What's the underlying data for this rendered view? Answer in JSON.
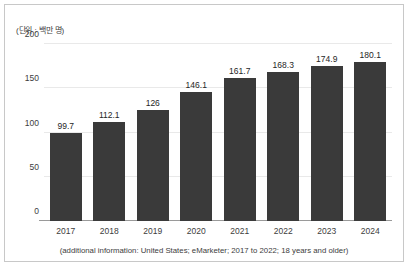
{
  "chart_data": {
    "type": "bar",
    "title": "",
    "subtitle": "",
    "unit_label": "(단위 : 백만 명)",
    "categories": [
      "2017",
      "2018",
      "2019",
      "2020",
      "2021",
      "2022",
      "2023",
      "2024"
    ],
    "values": [
      99.7,
      112.1,
      126,
      146.1,
      161.7,
      168.3,
      174.9,
      180.1
    ],
    "value_labels": [
      "99.7",
      "112.1",
      "126",
      "146.1",
      "161.7",
      "168.3",
      "174.9",
      "180.1"
    ],
    "xlabel": "",
    "ylabel": "",
    "ylim": [
      0,
      200
    ],
    "yticks": [
      0,
      50,
      100,
      150,
      200
    ],
    "ytick_labels": [
      "0",
      "50",
      "100",
      "150",
      "200"
    ],
    "grid": true,
    "legend": false,
    "legend_position": "none",
    "bar_color": "#3a3a3a",
    "background_color": "#ffffff",
    "gridline_color": "#e9e9e9",
    "footnote": "(additional information: United States; eMarketer; 2017 to 2022; 18 years and older)"
  }
}
